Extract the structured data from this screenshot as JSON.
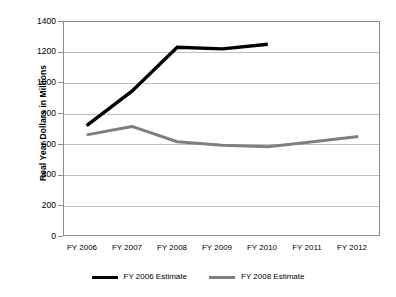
{
  "chart_data": {
    "type": "line",
    "title": "",
    "xlabel": "",
    "ylabel": "Real Year Dollars in Millions",
    "categories": [
      "FY 2006",
      "FY 2007",
      "FY 2008",
      "FY 2009",
      "FY 2010",
      "FY 2011",
      "FY 2012"
    ],
    "ylim": [
      0,
      1400
    ],
    "ytick_labels": [
      "1400",
      "1200",
      "1000",
      "800",
      "600",
      "400",
      "200",
      "0"
    ],
    "ytick_values": [
      1400,
      1200,
      1000,
      800,
      600,
      400,
      200,
      0
    ],
    "grid": true,
    "legend_position": "bottom",
    "series": [
      {
        "name": "FY 2006 Estimate",
        "color": "#000000",
        "values": [
          725,
          950,
          1235,
          1225,
          1255,
          null,
          null
        ]
      },
      {
        "name": "FY 2008 Estimate",
        "color": "#7f7f7f",
        "values": [
          665,
          720,
          620,
          597,
          588,
          620,
          655
        ]
      }
    ]
  },
  "axis": {
    "y_title": "Real Year Dollars in Millions",
    "y_labels": [
      "1400",
      "1200",
      "1000",
      "800",
      "600",
      "400",
      "200",
      "0"
    ],
    "x_labels": [
      "FY 2006",
      "FY 2007",
      "FY 2008",
      "FY 2009",
      "FY 2010",
      "FY 2011",
      "FY 2012"
    ]
  },
  "legend": {
    "entries": [
      {
        "label": "FY 2006 Estimate",
        "color": "#000000"
      },
      {
        "label": "FY 2008 Estimate",
        "color": "#7f7f7f"
      }
    ]
  },
  "colors": {
    "series_1": "#000000",
    "series_2": "#7f7f7f",
    "gridline": "#bfbfbf",
    "frame": "#8c8c8c",
    "background": "#ffffff"
  }
}
